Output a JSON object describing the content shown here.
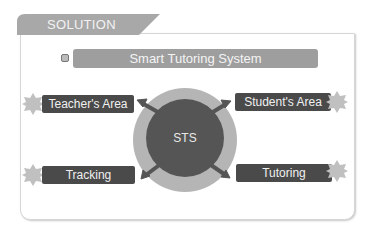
{
  "header": {
    "tab_label": "SOLUTION"
  },
  "title_bar": {
    "label": "Smart Tutoring System",
    "icon": "square-bullet-icon"
  },
  "center": {
    "label": "STS"
  },
  "nodes": [
    {
      "label": "Teacher's Area",
      "position": "top-left",
      "icon": "star-badge-icon"
    },
    {
      "label": "Student's Area",
      "position": "top-right",
      "icon": "star-badge-icon"
    },
    {
      "label": "Tracking",
      "position": "bottom-left",
      "icon": "star-badge-icon"
    },
    {
      "label": "Tutoring",
      "position": "bottom-right",
      "icon": "star-badge-icon"
    }
  ],
  "colors": {
    "tab": "#a8a8a8",
    "title_bar": "#9e9e9e",
    "label_bg": "#4a4a4a",
    "outer_ring": "#b5b5b5",
    "inner_circle": "#555555",
    "star": "#c0c0c0"
  }
}
